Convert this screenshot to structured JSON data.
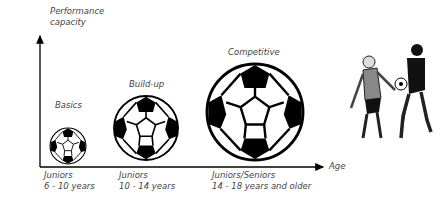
{
  "axes": {
    "y_label_line1": "Performance",
    "y_label_line2": "capacity",
    "x_label": "Age"
  },
  "stages": [
    {
      "name": "Basics",
      "group": "Juniors",
      "ages": "6 - 10 years"
    },
    {
      "name": "Build-up",
      "group": "Juniors",
      "ages": "10 - 14 years"
    },
    {
      "name": "Competitive",
      "group": "Juniors/Seniors",
      "ages": "14 - 18 years and older"
    }
  ],
  "illustration": {
    "description": "two soccer players contesting the ball"
  }
}
